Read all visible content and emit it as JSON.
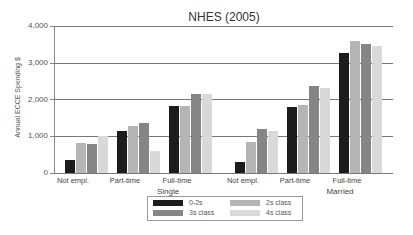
{
  "chart_data": {
    "type": "bar",
    "title": "NHES (2005)",
    "xlabel": "",
    "ylabel": "Annual ECCE Spending $",
    "ylim": [
      0,
      4000
    ],
    "yticks": [
      "0",
      "1,000",
      "2,000",
      "3,000",
      "4,000"
    ],
    "grid": true,
    "legend_position": "bottom",
    "groups": [
      "Single",
      "Married"
    ],
    "categories": [
      "Not empl.",
      "Part-time",
      "Full-time",
      "Not empl.",
      "Part-time",
      "Full-time"
    ],
    "series": [
      {
        "name": "0-2s",
        "color": "#1c1c1c",
        "values": [
          360,
          1150,
          1810,
          300,
          1790,
          3270
        ]
      },
      {
        "name": "2s class",
        "color": "#b5b5b5",
        "values": [
          820,
          1290,
          1810,
          840,
          1860,
          3600
        ]
      },
      {
        "name": "3s class",
        "color": "#858585",
        "values": [
          800,
          1370,
          2160,
          1210,
          2370,
          3500
        ]
      },
      {
        "name": "4s class",
        "color": "#d9d9d9",
        "values": [
          1000,
          600,
          2150,
          1150,
          2310,
          3450
        ]
      }
    ]
  }
}
